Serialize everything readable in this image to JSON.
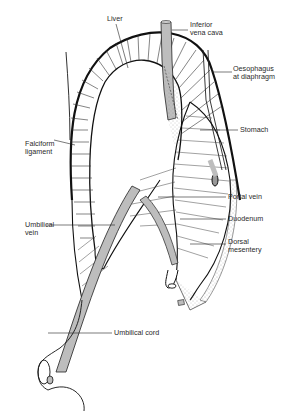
{
  "diagram": {
    "labels": {
      "liver": "Liver",
      "inferior_vena_cava": "Inferior\nvena cava",
      "oesophagus": "Oesophagus\nat diaphragm",
      "stomach": "Stomach",
      "falciform_ligament": "Falciform\nligament",
      "portal_vein": "Portal vein",
      "duodenum": "Duodenum",
      "umbilical_vein": "Umbilical\nvein",
      "dorsal_mesentery": "Dorsal\nmesentery",
      "umbilical_cord": "Umbilical cord"
    },
    "colors": {
      "line": "#1a1a1a",
      "vessel_fill": "#bdbdbd",
      "stipple": "#d8d8d8",
      "background": "#ffffff"
    }
  }
}
